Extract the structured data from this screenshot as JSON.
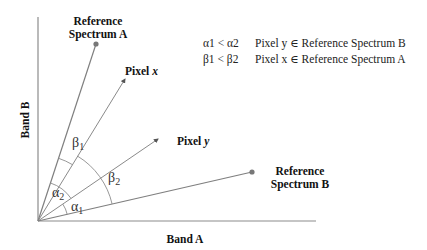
{
  "diagram": {
    "axes": {
      "x_label": "Band A",
      "y_label": "Band B"
    },
    "points": {
      "ref_a": {
        "label_line1": "Reference",
        "label_line2": "Spectrum A"
      },
      "ref_b": {
        "label_line1": "Reference",
        "label_line2": "Spectrum B"
      },
      "pixel_x": {
        "label_prefix": "Pixel ",
        "label_var": "x"
      },
      "pixel_y": {
        "label_prefix": "Pixel ",
        "label_var": "y"
      }
    },
    "angles": {
      "alpha1": {
        "sym": "α",
        "sub": "1"
      },
      "alpha2": {
        "sym": "α",
        "sub": "2"
      },
      "beta1": {
        "sym": "β",
        "sub": "1"
      },
      "beta2": {
        "sym": "β",
        "sub": "2"
      }
    },
    "legend": {
      "line1": {
        "condition": "α1 < α2",
        "result": "Pixel y ∈ Reference Spectrum B"
      },
      "line2": {
        "condition": "β1 < β2",
        "result": "Pixel x ∈ Reference Spectrum A"
      }
    },
    "colors": {
      "line": "#7f7f7f",
      "axis": "#8c8c8c",
      "text": "#000000"
    }
  }
}
